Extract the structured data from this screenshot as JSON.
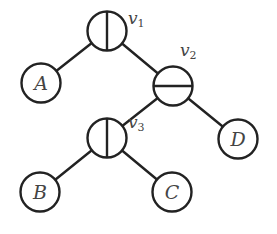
{
  "diagram": {
    "type": "binary-tree",
    "stroke_color": "#222222",
    "text_color": "#444444",
    "node_radius": 19.5,
    "internal_nodes": [
      {
        "id": "v1",
        "label_main": "v",
        "label_sub": "1",
        "split": "vertical",
        "cx": 107,
        "cy": 31,
        "label_x": 128,
        "label_y": 24
      },
      {
        "id": "v2",
        "label_main": "v",
        "label_sub": "2",
        "split": "horizontal",
        "cx": 173,
        "cy": 86,
        "label_x": 180,
        "label_y": 56
      },
      {
        "id": "v3",
        "label_main": "v",
        "label_sub": "3",
        "split": "vertical",
        "cx": 107,
        "cy": 138,
        "label_x": 128,
        "label_y": 128
      }
    ],
    "leaves": [
      {
        "id": "A",
        "label": "A",
        "cx": 41,
        "cy": 83
      },
      {
        "id": "B",
        "label": "B",
        "cx": 40,
        "cy": 192
      },
      {
        "id": "C",
        "label": "C",
        "cx": 172,
        "cy": 192
      },
      {
        "id": "D",
        "label": "D",
        "cx": 238,
        "cy": 139
      }
    ],
    "edges": [
      {
        "from": "v1",
        "to": "A"
      },
      {
        "from": "v1",
        "to": "v2"
      },
      {
        "from": "v2",
        "to": "v3"
      },
      {
        "from": "v2",
        "to": "D"
      },
      {
        "from": "v3",
        "to": "B"
      },
      {
        "from": "v3",
        "to": "C"
      }
    ]
  }
}
